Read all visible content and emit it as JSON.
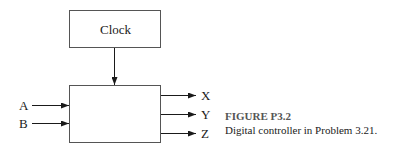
{
  "diagram": {
    "clock_label": "Clock",
    "inputs": [
      "A",
      "B"
    ],
    "outputs": [
      "X",
      "Y",
      "Z"
    ]
  },
  "caption": {
    "title": "FIGURE P3.2",
    "text": "Digital controller in Problem 3.21."
  }
}
